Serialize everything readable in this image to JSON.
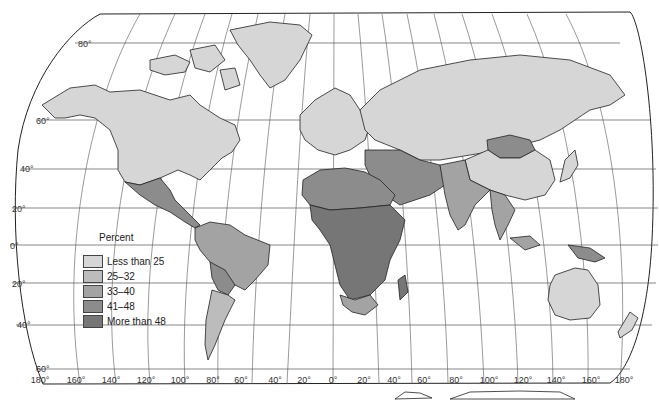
{
  "map": {
    "title": "",
    "legend": {
      "title": "Percent",
      "classes": [
        {
          "label": "Less than 25",
          "color": "#d6d6d6"
        },
        {
          "label": "25–32",
          "color": "#bcbcbc"
        },
        {
          "label": "33–40",
          "color": "#a3a3a3"
        },
        {
          "label": "41–48",
          "color": "#8c8c8c"
        },
        {
          "label": "More than 48",
          "color": "#767676"
        }
      ]
    },
    "latitude_labels": [
      "80°",
      "60°",
      "40°",
      "20°",
      "0°",
      "20°",
      "40°",
      "60°"
    ],
    "longitude_labels": [
      "180°",
      "160°",
      "140°",
      "120°",
      "100°",
      "80°",
      "60°",
      "40°",
      "20°",
      "0°",
      "20°",
      "40°",
      "60°",
      "80°",
      "100°",
      "120°",
      "140°",
      "160°",
      "180°"
    ],
    "regions": [
      {
        "name": "North America (US, Canada)",
        "class": "Less than 25"
      },
      {
        "name": "Mexico & Central America",
        "class": "41–48"
      },
      {
        "name": "Northern South America",
        "class": "33–40"
      },
      {
        "name": "Brazil",
        "class": "33–40"
      },
      {
        "name": "Bolivia/Paraguay",
        "class": "41–48"
      },
      {
        "name": "Argentina/Chile",
        "class": "25–32"
      },
      {
        "name": "Greenland",
        "class": "Less than 25"
      },
      {
        "name": "Europe",
        "class": "Less than 25"
      },
      {
        "name": "Soviet Union",
        "class": "Less than 25"
      },
      {
        "name": "North Africa",
        "class": "41–48"
      },
      {
        "name": "Sub-Saharan Africa",
        "class": "More than 48"
      },
      {
        "name": "South Africa",
        "class": "33–40"
      },
      {
        "name": "Middle East",
        "class": "41–48"
      },
      {
        "name": "South Asia",
        "class": "33–40"
      },
      {
        "name": "Mongolia",
        "class": "41–48"
      },
      {
        "name": "China",
        "class": "Less than 25"
      },
      {
        "name": "Japan",
        "class": "Less than 25"
      },
      {
        "name": "Southeast Asia",
        "class": "33–40"
      },
      {
        "name": "New Guinea",
        "class": "41–48"
      },
      {
        "name": "Australia",
        "class": "Less than 25"
      },
      {
        "name": "New Zealand",
        "class": "Less than 25"
      }
    ]
  }
}
